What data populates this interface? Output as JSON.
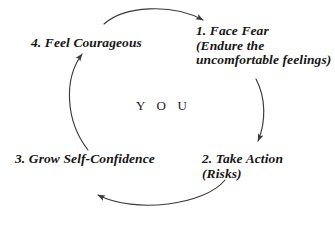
{
  "diagram": {
    "title_center": "Y O U",
    "background_color": "#ffffff",
    "ink_color": "#161616",
    "arrow_color": "#3a3a3a",
    "cycle_direction": "clockwise",
    "steps": [
      {
        "number": "1.",
        "lines": [
          "1. Face Fear",
          "(Endure the",
          "uncomfortable feelings)"
        ],
        "position": "top-right"
      },
      {
        "number": "2.",
        "lines": [
          "2. Take Action",
          "(Risks)"
        ],
        "position": "bottom-right"
      },
      {
        "number": "3.",
        "lines": [
          "3. Grow Self-Confidence"
        ],
        "position": "bottom-left"
      },
      {
        "number": "4.",
        "lines": [
          "4. Feel Courageous"
        ],
        "position": "top-left"
      }
    ],
    "arrows": [
      {
        "name": "arrow-4-to-1",
        "from": "4. Feel Courageous",
        "to": "1. Face Fear",
        "shape": "arc-top"
      },
      {
        "name": "arrow-1-to-2",
        "from": "1. Face Fear",
        "to": "2. Take Action",
        "shape": "arc-right"
      },
      {
        "name": "arrow-2-to-3",
        "from": "2. Take Action",
        "to": "3. Grow Self-Confidence",
        "shape": "arc-bottom"
      },
      {
        "name": "arrow-3-to-4",
        "from": "3. Grow Self-Confidence",
        "to": "4. Feel Courageous",
        "shape": "arc-left"
      }
    ]
  }
}
